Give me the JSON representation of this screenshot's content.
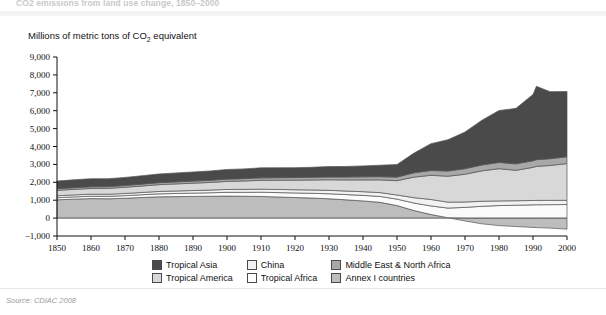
{
  "figure": {
    "title": "CO2 emissions from land use change, 1850–2000",
    "source": "Source: CDIAC 2008"
  },
  "axis": {
    "unit_label_pre": "Millions of metric tons of CO",
    "unit_label_sub": "2",
    "unit_label_post": " equivalent"
  },
  "legend": {
    "items": [
      {
        "label": "Tropical Asia",
        "color": "#4a4a4a"
      },
      {
        "label": "China",
        "color": "#f2f2f2"
      },
      {
        "label": "Middle East & North Africa",
        "color": "#a8a8a8"
      },
      {
        "label": "Tropical America",
        "color": "#d8d8d8"
      },
      {
        "label": "Tropical Africa",
        "color": "#fbfbfb"
      },
      {
        "label": "Annex I countries",
        "color": "#bdbdbd"
      }
    ]
  },
  "chart_data": {
    "type": "area",
    "stacked": true,
    "title": "CO2 emissions from land use change, 1850–2000",
    "xlabel": "",
    "ylabel": "Millions of metric tons of CO2 equivalent",
    "xlim": [
      1850,
      2000
    ],
    "ylim": [
      -1000,
      9000
    ],
    "ytick_labels": [
      "9,000",
      "8,000",
      "7,000",
      "6,000",
      "5,000",
      "4,000",
      "3,000",
      "2,000",
      "1,000",
      "0",
      "−1,000"
    ],
    "ytick_values": [
      9000,
      8000,
      7000,
      6000,
      5000,
      4000,
      3000,
      2000,
      1000,
      0,
      -1000
    ],
    "xtick_labels": [
      "1850",
      "1860",
      "1870",
      "1880",
      "1890",
      "1900",
      "1910",
      "1920",
      "1930",
      "1940",
      "1950",
      "1960",
      "1970",
      "1980",
      "1990",
      "2000"
    ],
    "xtick_values": [
      1850,
      1860,
      1870,
      1880,
      1890,
      1900,
      1910,
      1920,
      1930,
      1940,
      1950,
      1960,
      1970,
      1980,
      1990,
      2000
    ],
    "grid": false,
    "legend_position": "bottom",
    "x": [
      1850,
      1855,
      1860,
      1865,
      1870,
      1875,
      1880,
      1885,
      1890,
      1895,
      1900,
      1905,
      1910,
      1915,
      1920,
      1925,
      1930,
      1935,
      1940,
      1945,
      1950,
      1955,
      1960,
      1965,
      1970,
      1975,
      1980,
      1985,
      1990,
      1991,
      1995,
      2000
    ],
    "series": [
      {
        "name": "Annex I countries",
        "color": "#bdbdbd",
        "values": [
          1020,
          1060,
          1090,
          1080,
          1110,
          1150,
          1190,
          1200,
          1210,
          1220,
          1230,
          1220,
          1210,
          1180,
          1150,
          1120,
          1080,
          1020,
          960,
          880,
          700,
          420,
          200,
          20,
          -160,
          -320,
          -420,
          -470,
          -520,
          -530,
          -560,
          -620
        ]
      },
      {
        "name": "Tropical Africa",
        "color": "#fbfbfb",
        "values": [
          120,
          125,
          130,
          135,
          145,
          155,
          165,
          175,
          185,
          195,
          210,
          220,
          235,
          245,
          255,
          265,
          280,
          295,
          310,
          330,
          360,
          420,
          480,
          540,
          600,
          660,
          700,
          720,
          740,
          745,
          750,
          760
        ]
      },
      {
        "name": "China",
        "color": "#f2f2f2",
        "values": [
          110,
          112,
          115,
          118,
          122,
          128,
          134,
          140,
          146,
          152,
          160,
          165,
          172,
          176,
          180,
          186,
          192,
          198,
          205,
          215,
          230,
          300,
          360,
          330,
          300,
          280,
          260,
          250,
          245,
          245,
          240,
          235
        ]
      },
      {
        "name": "Tropical America",
        "color": "#d8d8d8",
        "values": [
          300,
          310,
          320,
          330,
          345,
          360,
          380,
          395,
          410,
          425,
          450,
          470,
          495,
          515,
          535,
          560,
          590,
          620,
          660,
          710,
          800,
          1150,
          1350,
          1450,
          1550,
          1700,
          1800,
          1700,
          1850,
          1900,
          1950,
          2050
        ]
      },
      {
        "name": "Middle East & North Africa",
        "color": "#a8a8a8",
        "values": [
          90,
          92,
          95,
          97,
          100,
          104,
          108,
          112,
          116,
          120,
          126,
          130,
          136,
          140,
          145,
          150,
          156,
          162,
          170,
          180,
          200,
          240,
          270,
          290,
          310,
          330,
          350,
          360,
          370,
          372,
          375,
          380
        ]
      },
      {
        "name": "Tropical Asia",
        "color": "#4a4a4a",
        "values": [
          430,
          440,
          450,
          440,
          450,
          470,
          490,
          500,
          510,
          520,
          540,
          545,
          560,
          555,
          550,
          560,
          580,
          590,
          610,
          640,
          700,
          1100,
          1500,
          1750,
          2050,
          2500,
          2900,
          3100,
          3700,
          4100,
          3750,
          3650
        ]
      }
    ]
  }
}
